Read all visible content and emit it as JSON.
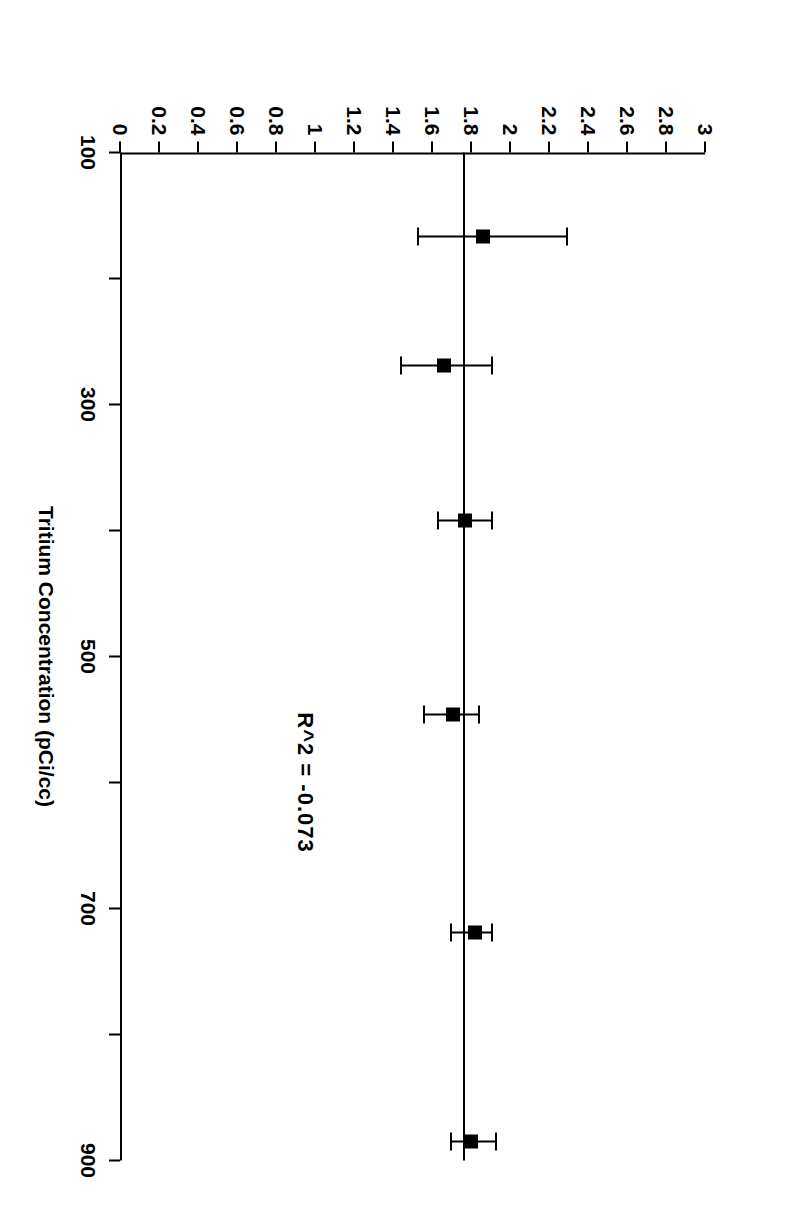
{
  "figure": {
    "rotation_degrees": 90,
    "background_color": "#ffffff",
    "ink_color": "#000000"
  },
  "annotation_text": "R^2 = -0.073",
  "chart_data": {
    "type": "scatter",
    "title": "",
    "subtitle": "",
    "xlabel": "Tritium Concentration (pCi/cc)",
    "ylabel": "Efficiency in Percent",
    "xlim": [
      100,
      900
    ],
    "ylim": [
      0,
      3
    ],
    "grid": false,
    "legend": null,
    "xticks": [
      100,
      200,
      300,
      400,
      500,
      600,
      700,
      800,
      900
    ],
    "xtick_labels": [
      "100",
      "",
      "300",
      "",
      "500",
      "",
      "700",
      "",
      "900"
    ],
    "yticks": [
      0,
      0.2,
      0.4,
      0.6,
      0.8,
      1,
      1.2,
      1.4,
      1.6,
      1.8,
      2,
      2.2,
      2.4,
      2.6,
      2.8,
      3
    ],
    "ytick_labels": [
      "0",
      "0.2",
      "0.4",
      "0.6",
      "0.8",
      "1",
      "1.2",
      "1.4",
      "1.6",
      "1.8",
      "2",
      "2.2",
      "2.4",
      "2.6",
      "2.8",
      "3"
    ],
    "marker_style": "filled-square",
    "errorbar_style": "horizontal-capped",
    "annotations": [
      {
        "text": "R^2 = -0.073",
        "x": 600,
        "y": 0.95
      }
    ],
    "fit_line": {
      "type": "horizontal",
      "y": 1.765,
      "x_start": 100,
      "x_end": 900,
      "r_squared": -0.073
    },
    "points": [
      {
        "x": 167,
        "y": 1.86,
        "yerr_low": 1.53,
        "yerr_high": 2.29
      },
      {
        "x": 269,
        "y": 1.66,
        "yerr_low": 1.44,
        "yerr_high": 1.91
      },
      {
        "x": 392,
        "y": 1.77,
        "yerr_low": 1.63,
        "yerr_high": 1.91
      },
      {
        "x": 546,
        "y": 1.71,
        "yerr_low": 1.56,
        "yerr_high": 1.84
      },
      {
        "x": 719,
        "y": 1.82,
        "yerr_low": 1.7,
        "yerr_high": 1.91
      },
      {
        "x": 885,
        "y": 1.8,
        "yerr_low": 1.7,
        "yerr_high": 1.93
      }
    ]
  }
}
